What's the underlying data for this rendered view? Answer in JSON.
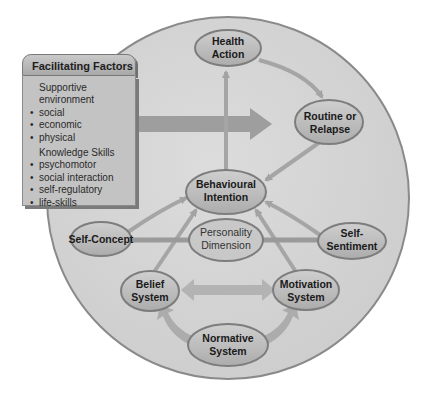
{
  "diagram": {
    "facilitating_factors": {
      "title": "Facilitating Factors",
      "sections": [
        {
          "heading": "Supportive environment",
          "items": [
            "social",
            "economic",
            "physical"
          ]
        },
        {
          "heading": "Knowledge Skills",
          "items": [
            "psychomotor",
            "social interaction",
            "self-regulatory",
            "life-skills"
          ]
        }
      ]
    },
    "nodes": {
      "health_action": {
        "line1": "Health",
        "line2": "Action"
      },
      "routine_relapse": {
        "line1": "Routine or",
        "line2": "Relapse"
      },
      "behavioural_intention": {
        "line1": "Behavioural",
        "line2": "Intention"
      },
      "personality_dimension": {
        "line1": "Personality",
        "line2": "Dimension"
      },
      "self_concept": {
        "line1": "Self-Concept"
      },
      "self_sentiment": {
        "line1": "Self-",
        "line2": "Sentiment"
      },
      "belief_system": {
        "line1": "Belief",
        "line2": "System"
      },
      "motivation_system": {
        "line1": "Motivation",
        "line2": "System"
      },
      "normative_system": {
        "line1": "Normative",
        "line2": "System"
      }
    },
    "colors": {
      "circle_fill": "#d4d4d4",
      "circle_stroke": "#8c8c8c",
      "node_fill": "#bdbdbd",
      "node_stroke": "#7f7f7f",
      "arrow": "#a9a9a9",
      "big_arrow": "#9c9c9c"
    }
  }
}
